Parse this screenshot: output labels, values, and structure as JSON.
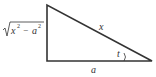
{
  "diagram": {
    "type": "right-triangle",
    "labels": {
      "hypotenuse": "x",
      "base": "a",
      "angle": "t",
      "vertical_radicand": "x² − a²",
      "vertical_radicand_x": "x",
      "vertical_radicand_a": "a",
      "vertical_exp": "2",
      "vertical_minus": "−"
    },
    "colors": {
      "stroke": "#333333",
      "background": "#ffffff"
    }
  }
}
